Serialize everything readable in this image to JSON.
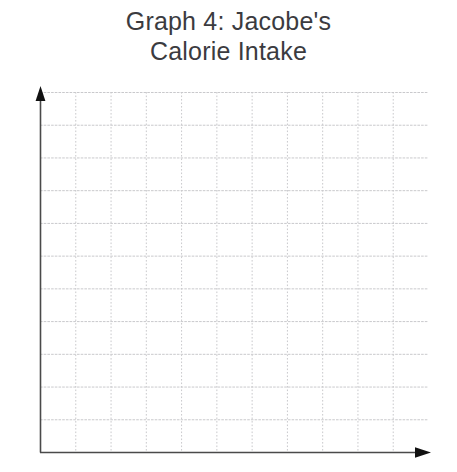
{
  "title": {
    "line1": "Graph 4: Jacobe's",
    "line2": "Calorie Intake"
  },
  "chart_data": {
    "type": "line",
    "title": "Graph 4: Jacobe's Calorie Intake",
    "subtitle": "",
    "xlabel": "",
    "ylabel": "",
    "series": [],
    "categories": [],
    "x": [],
    "values": [],
    "xtick_labels": [],
    "ytick_labels": [],
    "xlim": [
      0,
      11
    ],
    "ylim": [
      0,
      11
    ],
    "grid": true,
    "grid_columns": 11,
    "grid_rows": 11,
    "legend": false,
    "legend_position": "none",
    "annotations": [],
    "note": "Blank grid worksheet: no plotted data points, no axis tick labels, no legend."
  },
  "axes": {
    "y_axis_name": "vertical-axis",
    "x_axis_name": "horizontal-axis",
    "y_arrow": "arrow-up",
    "x_arrow": "arrow-right"
  },
  "colors": {
    "title_text": "#3b3b3f",
    "axis_line": "#4a4a4a",
    "grid_line": "#c9c9cc",
    "background": "#ffffff"
  }
}
